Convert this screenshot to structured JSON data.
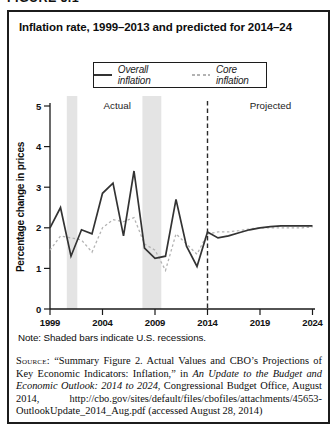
{
  "figure_label": "FIGURE 5.1",
  "legend": {
    "items": [
      {
        "label": "Overall inflation",
        "style": "solid"
      },
      {
        "label": "Core inflation",
        "style": "dotted"
      }
    ]
  },
  "chart_data": {
    "type": "line",
    "title": "Inflation rate, 1999–2013 and predicted for 2014–24",
    "xlabel": "",
    "ylabel": "Percentage change in prices",
    "xlim": [
      1999,
      2024
    ],
    "ylim": [
      0,
      5
    ],
    "x_ticks": [
      "1999",
      "2004",
      "2009",
      "2014",
      "2019",
      "2024"
    ],
    "y_ticks": [
      "0",
      "1",
      "2",
      "3",
      "4",
      "5"
    ],
    "grid": false,
    "legend_position": "top-center",
    "region_labels": [
      {
        "text": "Actual",
        "year": 2005.4
      },
      {
        "text": "Projected",
        "year": 2020
      }
    ],
    "projection_divider_year": 2014,
    "recession_bands": [
      [
        2000.6,
        2001.6
      ],
      [
        2007.8,
        2009.6
      ]
    ],
    "band_color": "#e4e4e4",
    "axis_color": "#1a1a1a",
    "x": [
      1999,
      2000,
      2001,
      2002,
      2003,
      2004,
      2005,
      2006,
      2007,
      2008,
      2009,
      2010,
      2011,
      2012,
      2013,
      2014,
      2015,
      2016,
      2017,
      2018,
      2019,
      2020,
      2021,
      2022,
      2023,
      2024
    ],
    "series": [
      {
        "name": "Overall inflation",
        "color": "#333333",
        "dash": "",
        "values": [
          2.0,
          2.5,
          1.3,
          1.95,
          1.85,
          2.85,
          3.1,
          1.8,
          3.4,
          1.5,
          1.25,
          1.3,
          2.7,
          1.55,
          1.05,
          1.9,
          1.75,
          1.8,
          1.88,
          1.95,
          2.0,
          2.03,
          2.05,
          2.05,
          2.05,
          2.05
        ]
      },
      {
        "name": "Core inflation",
        "color": "#b3b3b3",
        "dash": "2.5,2.5",
        "values": [
          1.45,
          1.8,
          1.75,
          1.7,
          1.4,
          2.0,
          2.2,
          2.15,
          2.25,
          1.6,
          1.45,
          0.95,
          1.85,
          1.6,
          1.35,
          1.85,
          1.9,
          1.9,
          1.93,
          1.97,
          2.0,
          2.0,
          2.0,
          2.0,
          2.0,
          2.02
        ]
      }
    ]
  },
  "note": "Note: Shaded bars indicate U.S. recessions.",
  "source": {
    "label": "Source:",
    "text_before_italic": "“Summary Figure 2. Actual Values and CBO’s Projections of Key Economic Indicators: Inflation,” in ",
    "italic_text": "An Update to the Budget and Economic Outlook: 2014 to 2024",
    "text_after_italic": ", Congressional Budget Office, August 2014, http://cbo.gov/sites/default/files/cbofiles/attachments/45653-OutlookUpdate_2014_Aug.pdf (accessed August 28, 2014)"
  }
}
